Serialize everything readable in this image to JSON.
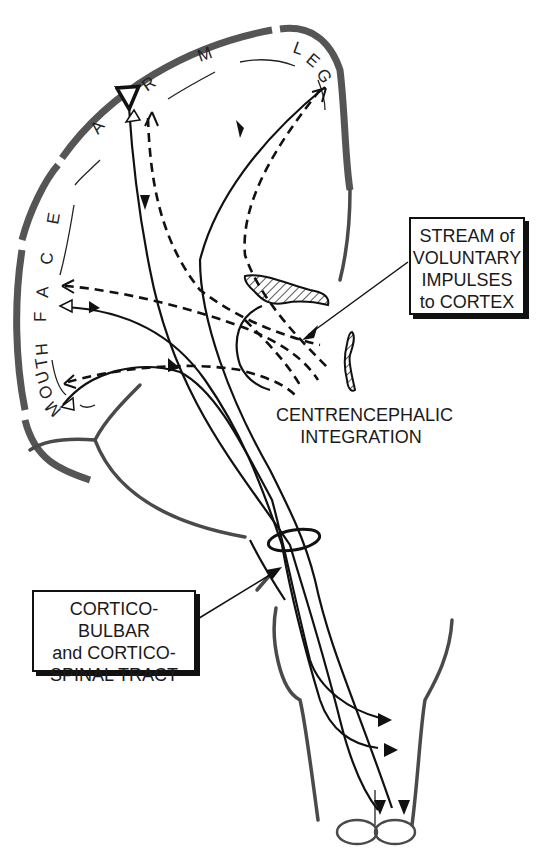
{
  "diagram": {
    "type": "neuroanatomy-schematic",
    "cortex_labels": {
      "mouth": "MOUTH",
      "face": "FACE",
      "arm": "ARM",
      "leg": "LEG",
      "face_letters": [
        "F",
        "A",
        "C",
        "E"
      ],
      "arm_letters": [
        "A",
        "R",
        "M"
      ],
      "leg_letters": [
        "L",
        "E",
        "G"
      ],
      "mouth_letters": [
        "M",
        "O",
        "U",
        "T",
        "H"
      ]
    },
    "callouts": {
      "stream": {
        "lines": [
          "STREAM of",
          "VOLUNTARY",
          "IMPULSES",
          "to CORTEX"
        ]
      },
      "tract": {
        "lines": [
          "CORTICO-BULBAR",
          "and CORTICO-",
          "SPINAL TRACT"
        ]
      },
      "centrencephalic": {
        "lines": [
          "CENTRENCEPHALIC",
          "INTEGRATION"
        ]
      }
    },
    "legend_semantics": {
      "solid_arrows": "efferent motor pathway (cortex to brainstem/spinal cord)",
      "dashed_arrows": "voluntary impulse stream from centrencephalic system to cortex"
    }
  }
}
